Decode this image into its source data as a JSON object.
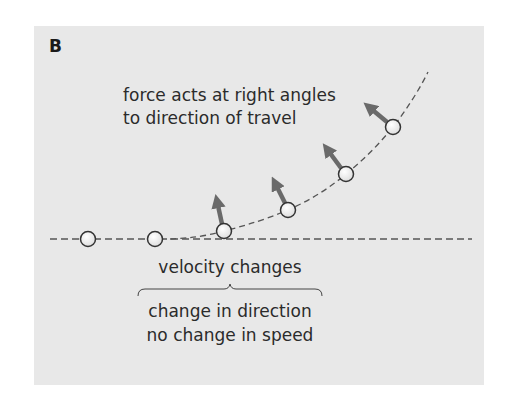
{
  "panel_label": "B",
  "annotations": {
    "force": [
      "force acts at right angles",
      "to direction of travel"
    ],
    "velocity": "velocity changes",
    "explanation": [
      "change in direction",
      "no change in speed"
    ]
  },
  "colors": {
    "panel_bg": "#e8e8e8",
    "arrow": "#6a6a6a",
    "dashed_line": "#555555",
    "ball_fill": "#f4f4f4",
    "ball_stroke": "#333333",
    "text": "#2b2b2b"
  },
  "diagram": {
    "balls": [
      {
        "x": 88,
        "y": 239
      },
      {
        "x": 155,
        "y": 239
      },
      {
        "x": 224,
        "y": 231
      },
      {
        "x": 288,
        "y": 210
      },
      {
        "x": 346,
        "y": 174
      },
      {
        "x": 393,
        "y": 127
      }
    ],
    "force_arrows": [
      {
        "from": [
          224,
          231
        ],
        "to": [
          216,
          194
        ]
      },
      {
        "from": [
          288,
          210
        ],
        "to": [
          272,
          176
        ]
      },
      {
        "from": [
          346,
          174
        ],
        "to": [
          323,
          143
        ]
      },
      {
        "from": [
          393,
          127
        ],
        "to": [
          364,
          102
        ]
      }
    ]
  }
}
